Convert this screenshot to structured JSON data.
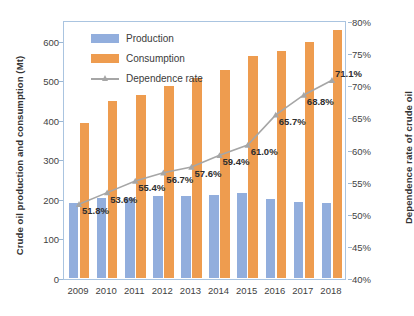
{
  "chart_data": {
    "type": "bar",
    "title": "",
    "subtitle": "",
    "categories": [
      "2009",
      "2010",
      "2011",
      "2012",
      "2013",
      "2014",
      "2015",
      "2016",
      "2017",
      "2018"
    ],
    "xlabel": "",
    "ylabel": "Crude oil production and consumption  (Mt)",
    "y2label": "Dependence rate of crude oil",
    "ylim": [
      0,
      650
    ],
    "y2lim": [
      40,
      80
    ],
    "y_ticks": [
      "0",
      "100",
      "200",
      "300",
      "400",
      "500",
      "600"
    ],
    "y_tick_values": [
      0,
      100,
      200,
      300,
      400,
      500,
      600
    ],
    "y2_ticks": [
      "40%",
      "45%",
      "50%",
      "55%",
      "60%",
      "65%",
      "70%",
      "75%",
      "80%"
    ],
    "y2_tick_values": [
      40,
      45,
      50,
      55,
      60,
      65,
      70,
      75,
      80
    ],
    "grid": false,
    "legend_position": "top-left",
    "series": [
      {
        "name": "Production",
        "type": "bar",
        "axis": "left",
        "color": "#92aedd",
        "values": [
          189,
          203,
          203,
          207,
          208,
          211,
          214,
          200,
          192,
          189
        ]
      },
      {
        "name": "Consumption",
        "type": "bar",
        "axis": "left",
        "color": "#ee9c4f",
        "values": [
          392,
          447,
          464,
          486,
          507,
          527,
          562,
          575,
          596,
          628
        ]
      },
      {
        "name": "Dependence rate",
        "type": "line",
        "axis": "right",
        "color": "#a6a6a6",
        "values": [
          51.8,
          53.6,
          55.4,
          56.7,
          57.6,
          59.4,
          61.0,
          65.7,
          68.8,
          71.1
        ],
        "labels": [
          "51.8%",
          "53.6%",
          "55.4%",
          "56.7%",
          "57.6%",
          "59.4%",
          "61.0%",
          "65.7%",
          "68.8%",
          "71.1%"
        ]
      }
    ]
  },
  "legend": {
    "items": [
      {
        "label": "Production",
        "kind": "bar-blue"
      },
      {
        "label": "Consumption",
        "kind": "bar-orange"
      },
      {
        "label": "Dependence rate",
        "kind": "line-marker"
      }
    ]
  },
  "colors": {
    "production": "#92aedd",
    "consumption": "#ee9c4f",
    "dependence_line": "#a6a6a6",
    "plot_border": "#aac4e0",
    "text": "#3b3b3b"
  }
}
